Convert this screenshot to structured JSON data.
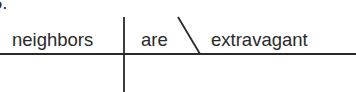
{
  "diagram": {
    "type": "sentence-diagram",
    "item_number_fragment": "5.",
    "subject": "neighbors",
    "verb": "are",
    "predicate_adjective": "extravagant",
    "line_color": "#2a2a2a"
  }
}
